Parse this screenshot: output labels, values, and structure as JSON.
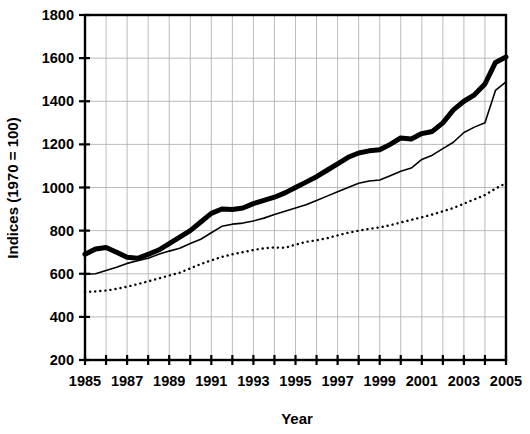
{
  "chart_data": {
    "type": "line",
    "title": "",
    "xlabel": "Year",
    "ylabel": "Indices (1970 = 100)",
    "xlim": [
      1985,
      2005
    ],
    "ylim": [
      200,
      1800
    ],
    "yticks": [
      200,
      400,
      600,
      800,
      1000,
      1200,
      1400,
      1600,
      1800
    ],
    "ytick_labels": [
      "200",
      "400",
      "600",
      "800",
      "1000",
      "1200",
      "1400",
      "1600",
      "1800"
    ],
    "xticks": [
      1985,
      1986,
      1987,
      1988,
      1989,
      1990,
      1991,
      1992,
      1993,
      1994,
      1995,
      1996,
      1997,
      1998,
      1999,
      2000,
      2001,
      2002,
      2003,
      2004,
      2005
    ],
    "xtick_labels": [
      "1985",
      "",
      "1987",
      "",
      "1989",
      "",
      "1991",
      "",
      "1993",
      "",
      "1995",
      "",
      "1997",
      "",
      "1999",
      "",
      "2001",
      "",
      "2003",
      "",
      "2005"
    ],
    "grid": true,
    "grid_color": "#aaaaaa",
    "legend": "none",
    "x": [
      1985,
      1985.5,
      1986,
      1986.5,
      1987,
      1987.5,
      1988,
      1988.5,
      1989,
      1989.5,
      1990,
      1990.5,
      1991,
      1991.5,
      1992,
      1992.5,
      1993,
      1993.5,
      1994,
      1994.5,
      1995,
      1995.5,
      1996,
      1996.5,
      1997,
      1997.5,
      1998,
      1998.5,
      1999,
      1999.5,
      2000,
      2000.5,
      2001,
      2001.5,
      2002,
      2002.5,
      2003,
      2003.5,
      2004,
      2004.5,
      2005
    ],
    "series": [
      {
        "name": "thick-solid-series",
        "style": "thick-solid",
        "color": "#000000",
        "linewidth": 5,
        "values": [
          690,
          715,
          722,
          700,
          676,
          672,
          690,
          710,
          740,
          770,
          800,
          840,
          880,
          900,
          898,
          905,
          925,
          940,
          955,
          975,
          1000,
          1025,
          1050,
          1080,
          1110,
          1140,
          1160,
          1170,
          1175,
          1200,
          1230,
          1225,
          1250,
          1260,
          1300,
          1360,
          1400,
          1430,
          1480,
          1580,
          1605
        ]
      },
      {
        "name": "thin-solid-series",
        "style": "thin-solid",
        "color": "#000000",
        "linewidth": 1.6,
        "values": [
          598,
          600,
          615,
          630,
          648,
          660,
          672,
          690,
          705,
          718,
          740,
          760,
          790,
          820,
          830,
          835,
          845,
          858,
          875,
          890,
          905,
          920,
          940,
          960,
          980,
          1000,
          1020,
          1030,
          1035,
          1055,
          1075,
          1090,
          1130,
          1150,
          1180,
          1210,
          1255,
          1280,
          1300,
          1450,
          1490
        ]
      },
      {
        "name": "dotted-series",
        "style": "dotted",
        "color": "#000000",
        "linewidth": 2.4,
        "values": [
          515,
          518,
          522,
          530,
          540,
          552,
          565,
          578,
          592,
          605,
          625,
          645,
          662,
          678,
          690,
          700,
          710,
          718,
          722,
          720,
          735,
          748,
          755,
          765,
          778,
          790,
          800,
          808,
          815,
          825,
          838,
          850,
          862,
          875,
          890,
          905,
          925,
          945,
          965,
          995,
          1020
        ]
      }
    ]
  },
  "layout": {
    "plot_left": 85,
    "plot_right": 506,
    "plot_top": 15,
    "plot_bottom": 360
  }
}
